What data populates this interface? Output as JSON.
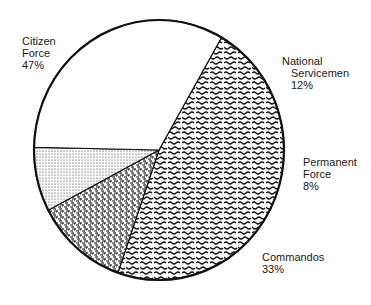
{
  "chart_data": {
    "type": "pie",
    "title": "",
    "start_angle_deg": 60,
    "direction": "clockwise",
    "slices": [
      {
        "label": "Citizen Force",
        "label_lines": [
          "Citizen",
          "Force",
          "47%"
        ],
        "value": 47,
        "value_label": "47%",
        "fill": "wavy-hatch"
      },
      {
        "label": "National Servicemen",
        "label_lines": [
          "National",
          "Servicemen",
          "12%"
        ],
        "value": 12,
        "value_label": "12%",
        "fill": "dense-speckle"
      },
      {
        "label": "Permanent Force",
        "label_lines": [
          "Permanent",
          "Force",
          "8%"
        ],
        "value": 8,
        "value_label": "8%",
        "fill": "fine-dots"
      },
      {
        "label": "Commandos",
        "label_lines": [
          "Commandos",
          "33%"
        ],
        "value": 33,
        "value_label": "33%",
        "fill": "none"
      }
    ],
    "units": "percent",
    "legend": "none (direct labels)",
    "colors": {
      "outline": "#111111",
      "background": "#ffffff"
    }
  }
}
